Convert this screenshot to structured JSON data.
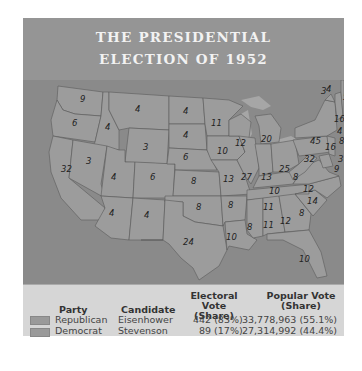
{
  "title": {
    "line1": "THE PRESIDENTIAL",
    "line2": "ELECTION OF 1952"
  },
  "map": {
    "states": [
      {
        "abbr": "WA",
        "ev": "9"
      },
      {
        "abbr": "OR",
        "ev": "6"
      },
      {
        "abbr": "CA",
        "ev": "32"
      },
      {
        "abbr": "ID",
        "ev": "4"
      },
      {
        "abbr": "NV",
        "ev": "3"
      },
      {
        "abbr": "MT",
        "ev": "4"
      },
      {
        "abbr": "WY",
        "ev": "3"
      },
      {
        "abbr": "UT",
        "ev": "4"
      },
      {
        "abbr": "CO",
        "ev": "6"
      },
      {
        "abbr": "AZ",
        "ev": "4"
      },
      {
        "abbr": "NM",
        "ev": "4"
      },
      {
        "abbr": "ND",
        "ev": "4"
      },
      {
        "abbr": "SD",
        "ev": "4"
      },
      {
        "abbr": "NE",
        "ev": "6"
      },
      {
        "abbr": "KS",
        "ev": "8"
      },
      {
        "abbr": "OK",
        "ev": "8"
      },
      {
        "abbr": "TX",
        "ev": "24"
      },
      {
        "abbr": "MN",
        "ev": "11"
      },
      {
        "abbr": "IA",
        "ev": "10"
      },
      {
        "abbr": "MO",
        "ev": "13"
      },
      {
        "abbr": "AR",
        "ev": "8"
      },
      {
        "abbr": "LA",
        "ev": "10"
      },
      {
        "abbr": "WI",
        "ev": "12"
      },
      {
        "abbr": "IL",
        "ev": "27"
      },
      {
        "abbr": "MI",
        "ev": "20"
      },
      {
        "abbr": "IN",
        "ev": "13"
      },
      {
        "abbr": "OH",
        "ev": "25"
      },
      {
        "abbr": "KY",
        "ev": "10"
      },
      {
        "abbr": "TN",
        "ev": "11"
      },
      {
        "abbr": "MS",
        "ev": "8"
      },
      {
        "abbr": "AL",
        "ev": "11"
      },
      {
        "abbr": "GA",
        "ev": "12"
      },
      {
        "abbr": "FL",
        "ev": "10"
      },
      {
        "abbr": "SC",
        "ev": "8"
      },
      {
        "abbr": "NC",
        "ev": "14"
      },
      {
        "abbr": "VA",
        "ev": "12"
      },
      {
        "abbr": "WV",
        "ev": "8"
      },
      {
        "abbr": "PA",
        "ev": "32"
      },
      {
        "abbr": "NY",
        "ev": "45"
      },
      {
        "abbr": "VT",
        "ev": "3"
      },
      {
        "abbr": "NH",
        "ev": "4"
      },
      {
        "abbr": "ME",
        "ev": "5"
      },
      {
        "abbr": "MA",
        "ev": "16"
      },
      {
        "abbr": "RI",
        "ev": "4"
      },
      {
        "abbr": "CT",
        "ev": "8"
      },
      {
        "abbr": "NJ",
        "ev": "16"
      },
      {
        "abbr": "DE",
        "ev": "3"
      },
      {
        "abbr": "MD",
        "ev": "9"
      }
    ]
  },
  "legend": {
    "headers": {
      "party": "Party",
      "candidate": "Candidate",
      "electoral_1": "Electoral Vote",
      "electoral_2": "(Share)",
      "popular_1": "Popular Vote",
      "popular_2": "(Share)"
    },
    "rows": [
      {
        "party": "Republican",
        "candidate": "Eisenhower",
        "electoral": "442 (83%)",
        "popular": "33,778,963 (55.1%)",
        "color": "#9a9a9a"
      },
      {
        "party": "Democrat",
        "candidate": "Stevenson",
        "electoral": "89 (17%)",
        "popular": "27,314,992 (44.4%)",
        "color": "#9a9a9a"
      }
    ]
  }
}
